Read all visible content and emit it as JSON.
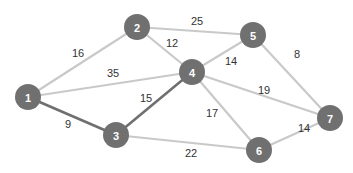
{
  "graph": {
    "colors": {
      "node": "#707070",
      "node_text": "#ffffff",
      "edge": "#c9c9c9",
      "highlight_edge": "#6f6f6f",
      "weight_text": "#333333"
    },
    "nodes": [
      {
        "id": "1",
        "label": "1",
        "x": 28,
        "y": 97
      },
      {
        "id": "2",
        "label": "2",
        "x": 137,
        "y": 27
      },
      {
        "id": "3",
        "label": "3",
        "x": 116,
        "y": 135
      },
      {
        "id": "4",
        "label": "4",
        "x": 192,
        "y": 72
      },
      {
        "id": "5",
        "label": "5",
        "x": 253,
        "y": 35
      },
      {
        "id": "6",
        "label": "6",
        "x": 259,
        "y": 150
      },
      {
        "id": "7",
        "label": "7",
        "x": 330,
        "y": 118
      }
    ],
    "edges": [
      {
        "from": "1",
        "to": "2",
        "weight": "16",
        "highlight": false,
        "lx": 78,
        "ly": 53
      },
      {
        "from": "1",
        "to": "4",
        "weight": "35",
        "highlight": false,
        "lx": 113,
        "ly": 73
      },
      {
        "from": "1",
        "to": "3",
        "weight": "9",
        "highlight": true,
        "lx": 68,
        "ly": 124
      },
      {
        "from": "2",
        "to": "5",
        "weight": "25",
        "highlight": false,
        "lx": 197,
        "ly": 21
      },
      {
        "from": "2",
        "to": "4",
        "weight": "12",
        "highlight": false,
        "lx": 172,
        "ly": 43
      },
      {
        "from": "3",
        "to": "4",
        "weight": "15",
        "highlight": true,
        "lx": 146,
        "ly": 98
      },
      {
        "from": "3",
        "to": "6",
        "weight": "22",
        "highlight": false,
        "lx": 191,
        "ly": 153
      },
      {
        "from": "4",
        "to": "5",
        "weight": "14",
        "highlight": false,
        "lx": 231,
        "ly": 61
      },
      {
        "from": "4",
        "to": "7",
        "weight": "19",
        "highlight": false,
        "lx": 264,
        "ly": 90
      },
      {
        "from": "4",
        "to": "6",
        "weight": "17",
        "highlight": false,
        "lx": 212,
        "ly": 113
      },
      {
        "from": "5",
        "to": "7",
        "weight": "8",
        "highlight": false,
        "lx": 297,
        "ly": 54
      },
      {
        "from": "6",
        "to": "7",
        "weight": "14",
        "highlight": false,
        "lx": 304,
        "ly": 128
      }
    ]
  }
}
